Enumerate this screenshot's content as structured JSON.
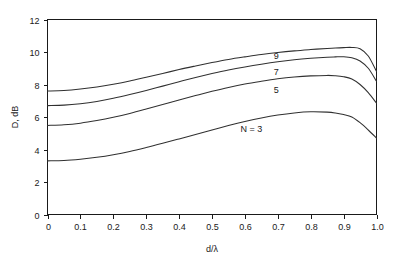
{
  "chart_data": {
    "type": "line",
    "title": "",
    "xlabel": "d/λ",
    "ylabel": "D, dB",
    "xlim": [
      0,
      1.0
    ],
    "ylim": [
      0,
      12
    ],
    "grid": false,
    "legend_position": "inline-curve-labels",
    "xticks": [
      "0",
      "0.1",
      "0.2",
      "0.3",
      "0.4",
      "0.5",
      "0.6",
      "0.7",
      "0.8",
      "0.9",
      "1.0"
    ],
    "xtick_values": [
      0,
      0.1,
      0.2,
      0.3,
      0.4,
      0.5,
      0.6,
      0.7,
      0.8,
      0.9,
      1.0
    ],
    "yticks": [
      "0",
      "2",
      "4",
      "6",
      "8",
      "10",
      "12"
    ],
    "ytick_values": [
      0,
      2,
      4,
      6,
      8,
      10,
      12
    ],
    "x": [
      0,
      0.05,
      0.1,
      0.15,
      0.2,
      0.25,
      0.3,
      0.35,
      0.4,
      0.45,
      0.5,
      0.55,
      0.6,
      0.65,
      0.7,
      0.75,
      0.8,
      0.85,
      0.875,
      0.9,
      0.925,
      0.95,
      0.975,
      1.0
    ],
    "series": [
      {
        "name": "9",
        "label": "9",
        "label_x": 0.695,
        "label_y": 9.55,
        "values": [
          7.6,
          7.63,
          7.72,
          7.85,
          8.02,
          8.22,
          8.45,
          8.68,
          8.92,
          9.14,
          9.35,
          9.54,
          9.7,
          9.85,
          9.97,
          10.07,
          10.15,
          10.22,
          10.25,
          10.27,
          10.28,
          10.2,
          9.75,
          8.8
        ]
      },
      {
        "name": "7",
        "label": "7",
        "label_x": 0.695,
        "label_y": 8.6,
        "values": [
          6.7,
          6.73,
          6.82,
          6.96,
          7.15,
          7.38,
          7.63,
          7.9,
          8.17,
          8.43,
          8.67,
          8.89,
          9.08,
          9.25,
          9.4,
          9.52,
          9.61,
          9.68,
          9.7,
          9.71,
          9.65,
          9.45,
          9.0,
          8.2
        ]
      },
      {
        "name": "5",
        "label": "5",
        "label_x": 0.695,
        "label_y": 7.5,
        "values": [
          5.48,
          5.52,
          5.62,
          5.78,
          5.98,
          6.22,
          6.49,
          6.77,
          7.05,
          7.32,
          7.58,
          7.82,
          8.03,
          8.2,
          8.35,
          8.46,
          8.53,
          8.56,
          8.54,
          8.48,
          8.34,
          8.0,
          7.5,
          6.85
        ]
      },
      {
        "name": "N = 3",
        "label": "N = 3",
        "label_x": 0.62,
        "label_y": 5.1,
        "values": [
          3.3,
          3.32,
          3.4,
          3.52,
          3.68,
          3.88,
          4.12,
          4.38,
          4.65,
          4.93,
          5.2,
          5.47,
          5.72,
          5.94,
          6.12,
          6.25,
          6.32,
          6.3,
          6.25,
          6.15,
          6.0,
          5.65,
          5.2,
          4.7
        ]
      }
    ]
  },
  "axes": {
    "x_title": "d/λ",
    "y_title": "D, dB"
  },
  "colors": {
    "curve": "#303030",
    "frame": "#1a1a1a",
    "background": "#ffffff",
    "text": "#1a1a1a"
  }
}
